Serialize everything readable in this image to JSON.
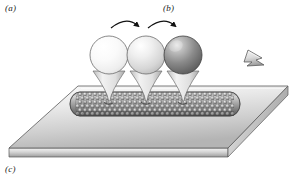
{
  "figure": {
    "labels": {
      "a": "(a)",
      "b": "(b)",
      "c": "(c)"
    },
    "colors": {
      "outline": "#4a4a4a",
      "slab_top_light": "#f2f2f2",
      "slab_top_dark": "#b9b9b9",
      "slab_edge_light": "#e3e3e3",
      "slab_edge_dark": "#9b9b9b",
      "tube_light": "#d8d8d8",
      "tube_dark": "#6e6e6e",
      "sphere1_light": "#ffffff",
      "sphere1_dark": "#e2e2e2",
      "sphere2_light": "#ffffff",
      "sphere2_dark": "#c0c0c0",
      "sphere3_light": "#d9d9d9",
      "sphere3_dark": "#5a5a5a",
      "arrow_fill_light": "#ededed",
      "arrow_fill_dark": "#a8a8a8",
      "motion_arrow": "#111111",
      "background": "#ffffff"
    },
    "elements": {
      "substrate_slab": "substrate slab",
      "nanotube": "carbon nanotube",
      "sphere_1": "light sphere stage 1",
      "sphere_2": "light gray sphere stage 2",
      "sphere_3": "dark gray sphere stage 3",
      "stem_1": "conical stem 1",
      "stem_2": "conical stem 2",
      "stem_3": "conical stem 3",
      "rotation_arrow_1": "curved rotation arrow 1",
      "rotation_arrow_2": "curved rotation arrow 2",
      "translation_arrow": "block translation arrow"
    },
    "geometry": {
      "width": 299,
      "height": 179,
      "spheres": [
        {
          "cx": 109,
          "cy": 55,
          "r": 19
        },
        {
          "cx": 146,
          "cy": 55,
          "r": 19
        },
        {
          "cx": 183,
          "cy": 55,
          "r": 19
        }
      ],
      "stems": [
        {
          "x": 109,
          "top": 73,
          "bottom": 104
        },
        {
          "x": 146,
          "top": 73,
          "bottom": 104
        },
        {
          "x": 183,
          "top": 73,
          "bottom": 104
        }
      ],
      "slab_top": [
        [
          78,
          86
        ],
        [
          288,
          86
        ],
        [
          228,
          148
        ],
        [
          9,
          148
        ]
      ],
      "slab_thickness": 9,
      "tube": {
        "x1": 76,
        "y1": 104,
        "x2": 234,
        "y2": 104,
        "ry": 12
      }
    }
  }
}
